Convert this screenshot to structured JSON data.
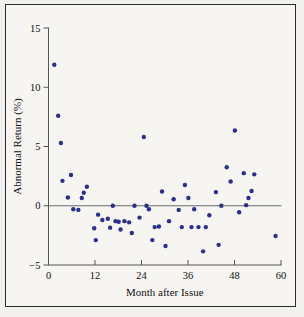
{
  "figure": {
    "background_color": "#f7f5f1",
    "frame_color": "#2b2b2b",
    "point_color": "#2b2f8f",
    "axis_color": "#555555"
  },
  "chart_data": {
    "type": "scatter",
    "title": "",
    "xlabel": "Month after Issue",
    "ylabel": "Abnormal Return (%)",
    "xlim": [
      0,
      60
    ],
    "ylim": [
      -5,
      15
    ],
    "xticks": [
      0,
      12,
      24,
      36,
      48,
      60
    ],
    "xtick_labels": [
      "0",
      "12",
      "24",
      "36",
      "48",
      "60"
    ],
    "yticks": [
      -5,
      0,
      5,
      10,
      15
    ],
    "ytick_labels": [
      "-5",
      "0",
      "5",
      "10",
      "15"
    ],
    "grid": false,
    "legend": null,
    "reference_line": {
      "axis": "y",
      "value": 0,
      "color": "#6b6b6b"
    },
    "series": [
      {
        "name": "Abnormal Return",
        "marker": "circle",
        "color": "#2b2f8f",
        "points": [
          [
            1.5,
            11.9
          ],
          [
            2.5,
            7.6
          ],
          [
            3.2,
            5.3
          ],
          [
            3.6,
            2.1
          ],
          [
            5.0,
            0.7
          ],
          [
            5.8,
            2.6
          ],
          [
            6.4,
            -0.3
          ],
          [
            7.7,
            -0.35
          ],
          [
            8.6,
            0.65
          ],
          [
            9.1,
            1.1
          ],
          [
            9.9,
            1.6
          ],
          [
            11.8,
            -1.9
          ],
          [
            12.2,
            -2.9
          ],
          [
            12.8,
            -0.75
          ],
          [
            13.9,
            -1.2
          ],
          [
            15.3,
            -1.1
          ],
          [
            15.9,
            -1.85
          ],
          [
            16.6,
            0.0
          ],
          [
            17.3,
            -1.3
          ],
          [
            18.1,
            -1.35
          ],
          [
            18.6,
            -2.0
          ],
          [
            19.6,
            -1.3
          ],
          [
            20.8,
            -1.4
          ],
          [
            21.5,
            -2.3
          ],
          [
            22.2,
            0.0
          ],
          [
            23.5,
            -1.0
          ],
          [
            24.6,
            5.8
          ],
          [
            25.3,
            0.0
          ],
          [
            25.9,
            -0.3
          ],
          [
            26.8,
            -2.9
          ],
          [
            27.4,
            -1.8
          ],
          [
            28.5,
            -1.75
          ],
          [
            29.3,
            1.2
          ],
          [
            30.2,
            -3.4
          ],
          [
            31.1,
            -1.3
          ],
          [
            32.3,
            0.55
          ],
          [
            33.6,
            -0.35
          ],
          [
            34.4,
            -1.8
          ],
          [
            35.2,
            1.75
          ],
          [
            36.1,
            0.65
          ],
          [
            36.9,
            -1.8
          ],
          [
            37.6,
            -0.3
          ],
          [
            38.7,
            -1.8
          ],
          [
            39.9,
            -3.85
          ],
          [
            40.6,
            -1.8
          ],
          [
            41.5,
            -0.8
          ],
          [
            43.2,
            1.15
          ],
          [
            43.9,
            -3.3
          ],
          [
            44.6,
            0.0
          ],
          [
            46.0,
            3.25
          ],
          [
            47.0,
            2.05
          ],
          [
            48.1,
            6.35
          ],
          [
            49.2,
            -0.55
          ],
          [
            50.4,
            2.75
          ],
          [
            51.0,
            0.05
          ],
          [
            51.6,
            0.65
          ],
          [
            52.4,
            1.25
          ],
          [
            53.1,
            2.65
          ],
          [
            58.6,
            -2.55
          ]
        ]
      }
    ]
  },
  "axes": {
    "x_title": "Month after Issue",
    "y_title": "Abnormal Return (%)"
  }
}
